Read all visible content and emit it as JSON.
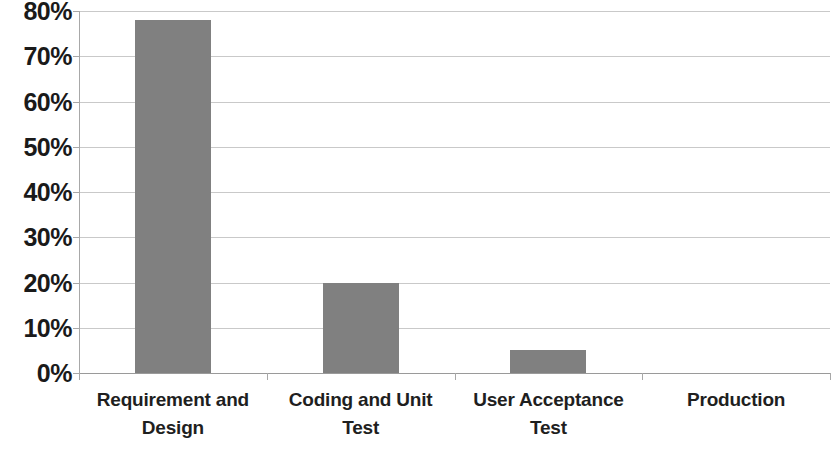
{
  "chart_data": {
    "type": "bar",
    "title": "",
    "subtitle": "",
    "xlabel": "",
    "ylabel": "",
    "categories": [
      "Requirement and Design",
      "Coding and Unit Test",
      "User Acceptance Test",
      "Production"
    ],
    "values": [
      78,
      20,
      5,
      0
    ],
    "value_labels": [
      "78%",
      "20%",
      "5%",
      "0%"
    ],
    "ylim": [
      0,
      80
    ],
    "ytick_values": [
      0,
      10,
      20,
      30,
      40,
      50,
      60,
      70,
      80
    ],
    "ytick_labels": [
      "0%",
      "10%",
      "20%",
      "30%",
      "40%",
      "50%",
      "60%",
      "70%",
      "80%"
    ],
    "grid": true,
    "legend": false,
    "legend_position": "none",
    "bar_color": "#808080",
    "gridline_color": "#c9c9c9",
    "axis_color": "#a8a8a8",
    "label_color": "#1a1a1a",
    "background_color": "#ffffff"
  }
}
